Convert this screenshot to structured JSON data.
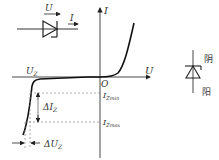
{
  "diagram": {
    "axes": {
      "x_label": "U",
      "y_label": "I",
      "origin_label": "O"
    },
    "labels": {
      "uz": "U",
      "uz_sub": "Z",
      "izmin": "I",
      "izmin_sub": "Zmin",
      "izmax": "I",
      "izmax_sub": "Zmax",
      "delta_iz": "ΔI",
      "delta_iz_sub": "Z",
      "delta_uz": "ΔU",
      "delta_uz_sub": "Z"
    },
    "diode_symbol": {
      "u_label": "U",
      "i_label": "I"
    },
    "zener_symbol": {
      "cathode_label": "阴",
      "anode_label": "阳"
    },
    "colors": {
      "line": "#222222",
      "dashed": "#888888",
      "text": "#333333"
    }
  }
}
